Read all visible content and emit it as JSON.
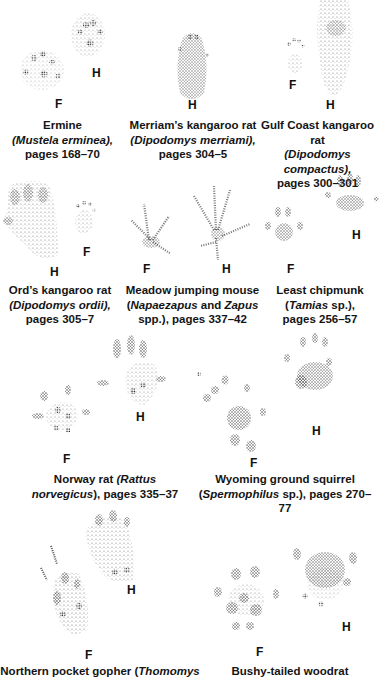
{
  "page": {
    "type": "field-guide-track-plate",
    "legend": {
      "F": "front foot",
      "H": "hind foot"
    }
  },
  "entries": [
    {
      "common": "Ermine",
      "open": "(",
      "sci": "Mustela erminea",
      "close": "),",
      "pages": "pages 168–70",
      "labels": [
        "F",
        "H"
      ]
    },
    {
      "common": "Merriam’s kangaroo rat",
      "open": "(",
      "sci": "Dipodomys merriami",
      "close": "),",
      "pages": "pages 304–5",
      "labels": [
        "H"
      ]
    },
    {
      "common": "Gulf Coast kangaroo rat",
      "open": "(",
      "sci": "Dipodomys compactus",
      "close": "),",
      "pages": "pages 300–301",
      "labels": [
        "F",
        "H"
      ]
    },
    {
      "common": "Ord’s kangaroo rat",
      "open": "(",
      "sci": "Dipodomys ordii",
      "close": "),",
      "pages": "pages 305–7",
      "labels": [
        "H",
        "F"
      ]
    },
    {
      "common": "Meadow jumping mouse",
      "open": "(",
      "sci": "Napaezapus",
      "mid": " and ",
      "sci2": "Zapus",
      "pages": "spp.), pages 337–42",
      "labels": [
        "F",
        "H"
      ]
    },
    {
      "common": "Least chipmunk",
      "open": "(",
      "sci": "Tamias",
      "close": " sp.),",
      "pages": "pages 256–57",
      "labels": [
        "F",
        "H"
      ]
    },
    {
      "common": "Norway rat ",
      "open": "(",
      "sci": "Rattus",
      "sci_line2": "norvegicus",
      "close": "), pages 335–37",
      "labels": [
        "F",
        "H"
      ]
    },
    {
      "common": "Wyoming ground squirrel",
      "open": "(",
      "sci": "Spermophilus",
      "close": " sp.), pages 270–77",
      "labels": [
        "F",
        "H"
      ]
    },
    {
      "common": "Northern pocket gopher (",
      "sci": "Thomomys",
      "labels": [
        "F",
        "H"
      ]
    },
    {
      "common": "Bushy-tailed woodrat",
      "labels": [
        "F",
        "H"
      ]
    }
  ]
}
